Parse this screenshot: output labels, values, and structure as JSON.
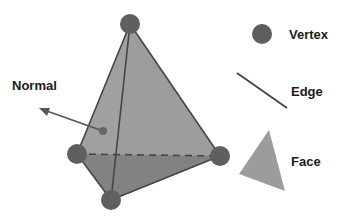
{
  "diagram": {
    "labels": {
      "normal": "Normal",
      "vertex": "Vertex",
      "edge": "Edge",
      "face": "Face"
    },
    "legend": [
      {
        "icon": "vertex-dot-icon",
        "label": "Vertex"
      },
      {
        "icon": "edge-line-icon",
        "label": "Edge"
      },
      {
        "icon": "face-triangle-icon",
        "label": "Face"
      }
    ],
    "colors": {
      "face_light": "#a0a0a0",
      "face_dark": "#7e7e7e",
      "edge": "#444444",
      "vertex": "#5e5e5e",
      "legend_face": "#9c9c9c",
      "normal_arrow": "#555555"
    }
  }
}
